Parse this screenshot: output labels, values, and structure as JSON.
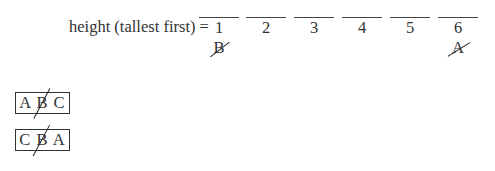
{
  "equation": {
    "label": "height (tallest first) =",
    "slots": [
      {
        "position": "1",
        "mark": "B",
        "crossed": true
      },
      {
        "position": "2",
        "mark": "",
        "crossed": false
      },
      {
        "position": "3",
        "mark": "",
        "crossed": false
      },
      {
        "position": "4",
        "mark": "",
        "crossed": false
      },
      {
        "position": "5",
        "mark": "",
        "crossed": false
      },
      {
        "position": "6",
        "mark": "A",
        "crossed": true
      }
    ]
  },
  "boxes": [
    {
      "text": "A B C",
      "crossed_letter": "B"
    },
    {
      "text": "C B A",
      "crossed_letter": "B"
    }
  ]
}
